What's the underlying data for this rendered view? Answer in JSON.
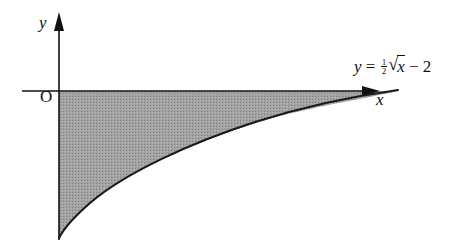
{
  "figure": {
    "y_axis_label": "y",
    "x_axis_label": "x",
    "origin_label": "O",
    "curve_label": {
      "lhs": "y",
      "equals": "=",
      "frac_num": "1",
      "frac_den": "2",
      "radical": "√",
      "radicand": "x",
      "tail": "− 2",
      "full": "y = ½√x − 2"
    },
    "shaded_region": "area between curve and x-axis from x = 0 to root at x = 16",
    "colors": {
      "axes": "#111111",
      "curve": "#1a1a1a",
      "shade": "#9a9a9a",
      "background": "#ffffff"
    }
  }
}
